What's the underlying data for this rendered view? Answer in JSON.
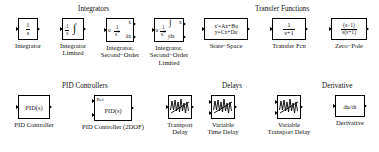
{
  "library": {
    "title": "Simulink Continuous Library Palette",
    "background_color": "#ffffff",
    "line_color": "#000000",
    "text_color": "#111111"
  },
  "sections": [
    {
      "id": "integrators",
      "label": "Integrators"
    },
    {
      "id": "transfer_functions",
      "label": "Transfer Functions"
    },
    {
      "id": "pid_controllers",
      "label": "PID Controllers"
    },
    {
      "id": "delays",
      "label": "Delays"
    },
    {
      "id": "derivative",
      "label": "Derivative"
    }
  ],
  "blocks": [
    {
      "id": "integrator",
      "caption": "Integrator",
      "icon_name": "integrator-block-icon",
      "numerator": "1",
      "denominator": "s",
      "ports_in": 1,
      "ports_out": 1
    },
    {
      "id": "integrator_limited",
      "caption": "Integrator\nLimited",
      "icon_name": "integrator-limited-block-icon",
      "numerator": "1",
      "denominator": "s",
      "integral_symbol": "∫",
      "ports_in": 1,
      "ports_out": 1
    },
    {
      "id": "integrator_second_order",
      "caption": "Integrator,\nSecond−Order",
      "icon_name": "integrator-second-order-block-icon",
      "input_label": "u",
      "numerator": "1",
      "denominator": "s",
      "denominator_exponent": "2",
      "output_label_1": "x",
      "output_label_2": "dx",
      "ports_in": 1,
      "ports_out": 2
    },
    {
      "id": "integrator_second_order_limited",
      "caption": "Integrator,\nSecond−Order\nLimited",
      "icon_name": "integrator-second-order-limited-block-icon",
      "input_label": "u",
      "numerator": "1",
      "denominator": "s",
      "denominator_exponent": "2",
      "integral_symbol": "∫",
      "output_label_1": "x",
      "output_label_2": "∫dx",
      "ports_in": 1,
      "ports_out": 2
    },
    {
      "id": "state_space",
      "caption": "State−Space",
      "icon_name": "state-space-block-icon",
      "equation_line_1": "x'=Ax+Bu",
      "equation_line_2": "y=Cx+Du",
      "ports_in": 1,
      "ports_out": 1
    },
    {
      "id": "transfer_fcn",
      "caption": "Transfer Fcn",
      "icon_name": "transfer-fcn-block-icon",
      "numerator": "1",
      "denominator": "s+1",
      "ports_in": 1,
      "ports_out": 1
    },
    {
      "id": "zero_pole",
      "caption": "Zero−Pole",
      "icon_name": "zero-pole-block-icon",
      "numerator": "(s−1)",
      "denominator": "s(s+1)",
      "ports_in": 1,
      "ports_out": 1
    },
    {
      "id": "pid_controller",
      "caption": "PID Controller",
      "icon_name": "pid-controller-block-icon",
      "body_text": "PID(s)",
      "ports_in": 1,
      "ports_out": 1
    },
    {
      "id": "pid_controller_2dof",
      "caption": "PID Controller (2DOF)",
      "icon_name": "pid-controller-2dof-block-icon",
      "corner_label": "Ref",
      "body_text": "PID(s)",
      "ports_in": 2,
      "ports_out": 1
    },
    {
      "id": "transport_delay",
      "caption": "Transport\nDelay",
      "icon_name": "transport-delay-block-icon",
      "ports_in": 1,
      "ports_out": 1
    },
    {
      "id": "variable_time_delay",
      "caption": "Variable\nTime Delay",
      "icon_name": "variable-time-delay-block-icon",
      "ports_in": 2,
      "ports_out": 1
    },
    {
      "id": "variable_transport_delay",
      "caption": "Variable\nTransport Delay",
      "icon_name": "variable-transport-delay-block-icon",
      "ports_in": 2,
      "ports_out": 1
    },
    {
      "id": "derivative",
      "caption": "Derivative",
      "icon_name": "derivative-block-icon",
      "body_text": "du/dt",
      "ports_in": 1,
      "ports_out": 1
    }
  ]
}
